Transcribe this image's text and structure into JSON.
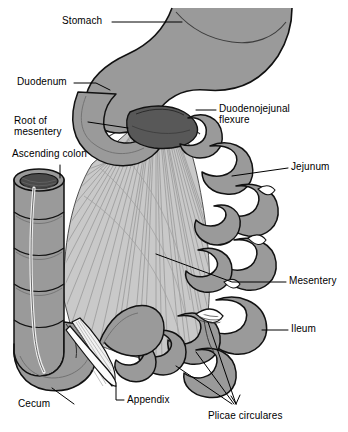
{
  "figure": {
    "width": 348,
    "height": 432,
    "background_color": "#ffffff"
  },
  "palette": {
    "organ_fill": "#9a9a9a",
    "organ_fill_light": "#a8a8a8",
    "organ_shadow": "#7d7d7d",
    "flexure_dark": "#585858",
    "lumen_dark": "#4a4a4a",
    "mesentery_fill": "#c9c9c9",
    "mesentery_line": "#8e8e8e",
    "appendix_fill": "#f2f2f2",
    "outline": "#111111",
    "label_text": "#000000",
    "leader_line": "#000000"
  },
  "labels": [
    {
      "id": "stomach",
      "text": "Stomach",
      "lines": [
        "Stomach"
      ]
    },
    {
      "id": "duodenum",
      "text": "Duodenum",
      "lines": [
        "Duodenum"
      ]
    },
    {
      "id": "root-of-mesentery",
      "text": "Root of mesentery",
      "lines": [
        "Root of",
        "mesentery"
      ]
    },
    {
      "id": "ascending-colon",
      "text": "Ascending colon",
      "lines": [
        "Ascending colon"
      ]
    },
    {
      "id": "duodenojejunal-flexure",
      "text": "Duodenojejunal flexure",
      "lines": [
        "Duodenojejunal",
        "flexure"
      ]
    },
    {
      "id": "jejunum",
      "text": "Jejunum",
      "lines": [
        "Jejunum"
      ]
    },
    {
      "id": "mesentery",
      "text": "Mesentery",
      "lines": [
        "Mesentery"
      ]
    },
    {
      "id": "ileum",
      "text": "Ileum",
      "lines": [
        "Ileum"
      ]
    },
    {
      "id": "cecum",
      "text": "Cecum",
      "lines": [
        "Cecum"
      ]
    },
    {
      "id": "appendix",
      "text": "Appendix",
      "lines": [
        "Appendix"
      ]
    },
    {
      "id": "plicae-circulares",
      "text": "Plicae circulares",
      "lines": [
        "Plicae circulares"
      ]
    }
  ],
  "label_text": {
    "stomach": "Stomach",
    "duodenum": "Duodenum",
    "root_of": "Root of",
    "mesentery_word": "mesentery",
    "ascending_colon": "Ascending colon",
    "duodenojejunal": "Duodenojejunal",
    "flexure": "flexure",
    "jejunum": "Jejunum",
    "mesentery": "Mesentery",
    "ileum": "Ileum",
    "cecum": "Cecum",
    "appendix": "Appendix",
    "plicae_circulares": "Plicae circulares"
  }
}
